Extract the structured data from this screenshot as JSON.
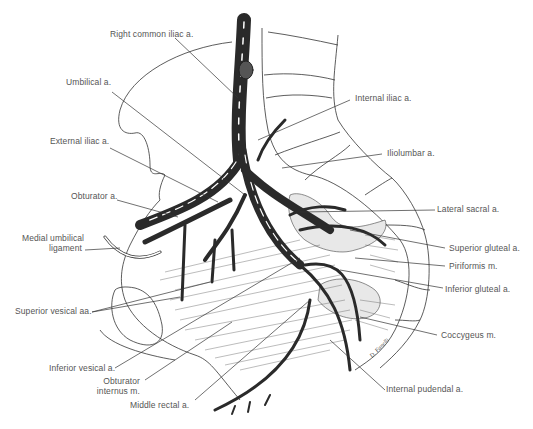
{
  "figure": {
    "colors": {
      "artery": "#2a2a2a",
      "outline": "#333333",
      "label": "#555555",
      "muscle_fill": "#e6e6e6"
    },
    "labels": {
      "right_common_iliac": "Right common iliac a.",
      "umbilical": "Umbilical a.",
      "external_iliac": "External iliac a.",
      "obturator": "Obturator a.",
      "medial_umbilical_1": "Medial umbilical",
      "medial_umbilical_2": "ligament",
      "superior_vesical": "Superior vesical aa.",
      "inferior_vesical": "Inferior vesical a.",
      "obturator_internus_1": "Obturator",
      "obturator_internus_2": "internus m.",
      "middle_rectal": "Middle rectal a.",
      "internal_iliac": "Internal iliac a.",
      "iliolumbar": "Iliolumbar a.",
      "lateral_sacral": "Lateral sacral a.",
      "superior_gluteal": "Superior gluteal a.",
      "piriformis": "Piriformis m.",
      "inferior_gluteal": "Inferior gluteal a.",
      "coccygeus": "Coccygeus m.",
      "internal_pudendal": "Internal pudendal a."
    },
    "signature": "D. Fanelli"
  }
}
